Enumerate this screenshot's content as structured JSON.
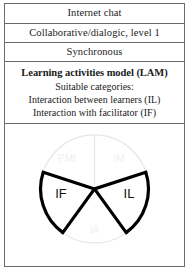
{
  "figure": {
    "rows": [
      {
        "label": "Internet chat"
      },
      {
        "label": "Collaborative/dialogic, level 1"
      },
      {
        "label": "Synchronous"
      }
    ],
    "lam": {
      "title": "Learning activities model (LAM)",
      "subtitle": "Suitable categories:",
      "items": [
        "Interaction between learners (IL)",
        "Interaction with facilitator (IF)"
      ]
    },
    "diagram": {
      "type": "pie",
      "description": "Circular learning activities model with five sectors; the IF and IL sectors are highlighted",
      "highlight_color": "#000000",
      "faint_color": "#e6e6e6",
      "sectors": [
        {
          "code": "PMI",
          "highlighted": false
        },
        {
          "code": "IM",
          "highlighted": false
        },
        {
          "code": "IL",
          "highlighted": true
        },
        {
          "code": "IA",
          "highlighted": false
        },
        {
          "code": "IF",
          "highlighted": true
        }
      ]
    }
  }
}
